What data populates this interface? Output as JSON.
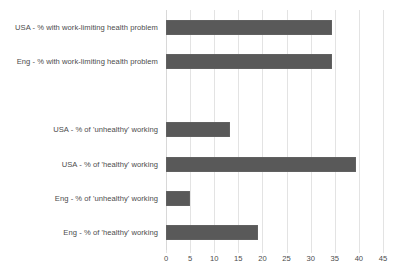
{
  "chart_data": {
    "type": "bar",
    "orientation": "horizontal",
    "title": "",
    "subtitle": "",
    "xlabel": "",
    "ylabel": "",
    "xlim": [
      0,
      45
    ],
    "xticks": [
      0,
      5,
      10,
      15,
      20,
      25,
      30,
      35,
      40,
      45
    ],
    "xtick_labels": [
      "0",
      "5",
      "10",
      "15",
      "20",
      "25",
      "30",
      "35",
      "40",
      "45"
    ],
    "grid": true,
    "legend": false,
    "legend_position": "none",
    "categories": [
      "USA - % with work-limiting health problem",
      "Eng - % with work-limiting health problem",
      "",
      "USA - % of 'unhealthy' working",
      "USA - % of 'healthy' working",
      "Eng - % of 'unhealthy' working",
      "Eng - % of 'healthy' working"
    ],
    "values": [
      34.5,
      34.5,
      null,
      13.3,
      39.3,
      5.0,
      19.0
    ],
    "bars": [
      {
        "label": "USA - % with work-limiting health problem",
        "value": 34.5
      },
      {
        "label": "Eng - % with work-limiting health problem",
        "value": 34.5
      },
      {
        "label": "",
        "value": null
      },
      {
        "label": "USA - % of 'unhealthy' working",
        "value": 13.3
      },
      {
        "label": "USA - % of 'healthy' working",
        "value": 39.3
      },
      {
        "label": "Eng - % of 'unhealthy' working",
        "value": 5.0
      },
      {
        "label": "Eng - % of 'healthy' working",
        "value": 19.0
      }
    ],
    "colors": {
      "bar": "#595959",
      "gridline": "#e3e3e3",
      "axis": "#d8d8d8",
      "text": "#4c4c4c",
      "background": "#ffffff"
    }
  },
  "artifacts": {
    "line1": "",
    "line2": ""
  }
}
